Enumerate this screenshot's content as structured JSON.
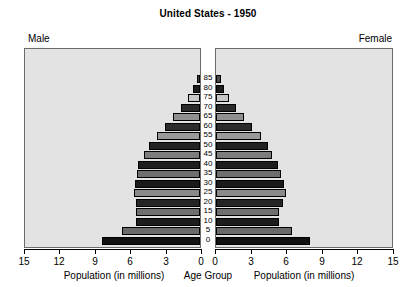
{
  "chart_data": {
    "type": "bar",
    "subtype": "population-pyramid",
    "title": "United States - 1950",
    "xlabel": "Population (in millions)",
    "ylabel": "Age Group",
    "center_axis_label": "Age Group",
    "left_panel_label": "Male",
    "right_panel_label": "Female",
    "grid": false,
    "legend": "none",
    "xlim_left": [
      15,
      0
    ],
    "xlim_right": [
      0,
      15
    ],
    "left_ticks": [
      "15",
      "12",
      "9",
      "6",
      "3",
      "0"
    ],
    "right_ticks": [
      "0",
      "3",
      "6",
      "9",
      "12",
      "15"
    ],
    "tick_values": [
      0,
      3,
      6,
      9,
      12,
      15
    ],
    "categories": [
      "85",
      "80",
      "75",
      "70",
      "65",
      "60",
      "55",
      "50",
      "45",
      "40",
      "35",
      "30",
      "25",
      "20",
      "15",
      "10",
      "5",
      "0"
    ],
    "series": [
      {
        "name": "Male",
        "side": "left",
        "values": [
          0.3,
          0.6,
          1.0,
          1.6,
          2.3,
          3.0,
          3.7,
          4.4,
          4.8,
          5.3,
          5.4,
          5.6,
          5.7,
          5.5,
          5.5,
          5.5,
          6.7,
          8.4
        ]
      },
      {
        "name": "Female",
        "side": "right",
        "values": [
          0.4,
          0.7,
          1.1,
          1.7,
          2.4,
          3.1,
          3.8,
          4.4,
          4.8,
          5.3,
          5.5,
          5.8,
          6.0,
          5.7,
          5.4,
          5.4,
          6.5,
          8.0
        ]
      }
    ],
    "bar_fills": [
      "#4a4a4a",
      "#1c1c1c",
      "#c8c8c8",
      "#2b2b2b",
      "#8f8f8f",
      "#2b2b2b",
      "#9a9a9a",
      "#222222",
      "#7d7d7d",
      "#1e1e1e",
      "#6f6f6f",
      "#1a1a1a",
      "#8a8a8a",
      "#252525",
      "#707070",
      "#1d1d1d",
      "#6a6a6a",
      "#111111"
    ],
    "colors": {
      "panel_background": "#e3e3e3",
      "panel_border": "#6b6b6b",
      "axis": "#000000",
      "text": "#000000",
      "page_background": "#ffffff"
    }
  }
}
